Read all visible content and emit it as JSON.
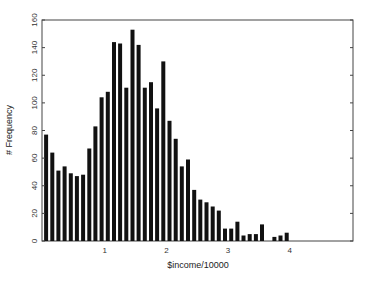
{
  "chart_data": {
    "type": "bar",
    "title": "",
    "xlabel": "$income/10000",
    "ylabel": "# Frequency",
    "xlim": [
      0,
      5
    ],
    "ylim": [
      0,
      160
    ],
    "x_ticks": [
      1,
      2,
      3,
      4
    ],
    "y_ticks": [
      0,
      20,
      40,
      60,
      80,
      100,
      120,
      140,
      160
    ],
    "grid": false,
    "legend": null,
    "bar_color": "#111111",
    "bin_width": 0.1,
    "x": [
      0.05,
      0.15,
      0.25,
      0.35,
      0.45,
      0.55,
      0.65,
      0.75,
      0.85,
      0.95,
      1.05,
      1.15,
      1.25,
      1.35,
      1.45,
      1.55,
      1.65,
      1.75,
      1.85,
      1.95,
      2.05,
      2.15,
      2.25,
      2.35,
      2.45,
      2.55,
      2.65,
      2.75,
      2.85,
      2.95,
      3.05,
      3.15,
      3.25,
      3.35,
      3.45,
      3.55,
      3.65,
      3.75,
      3.85,
      3.95,
      4.05,
      4.15,
      4.25,
      4.35
    ],
    "values": [
      77,
      64,
      51,
      54,
      49,
      47,
      48,
      67,
      83,
      104,
      108,
      144,
      143,
      111,
      153,
      142,
      111,
      115,
      96,
      130,
      87,
      74,
      54,
      59,
      37,
      30,
      28,
      25,
      22,
      9,
      9,
      14,
      4,
      5,
      5,
      12,
      0,
      3,
      4,
      6,
      0,
      0,
      0,
      0
    ]
  }
}
